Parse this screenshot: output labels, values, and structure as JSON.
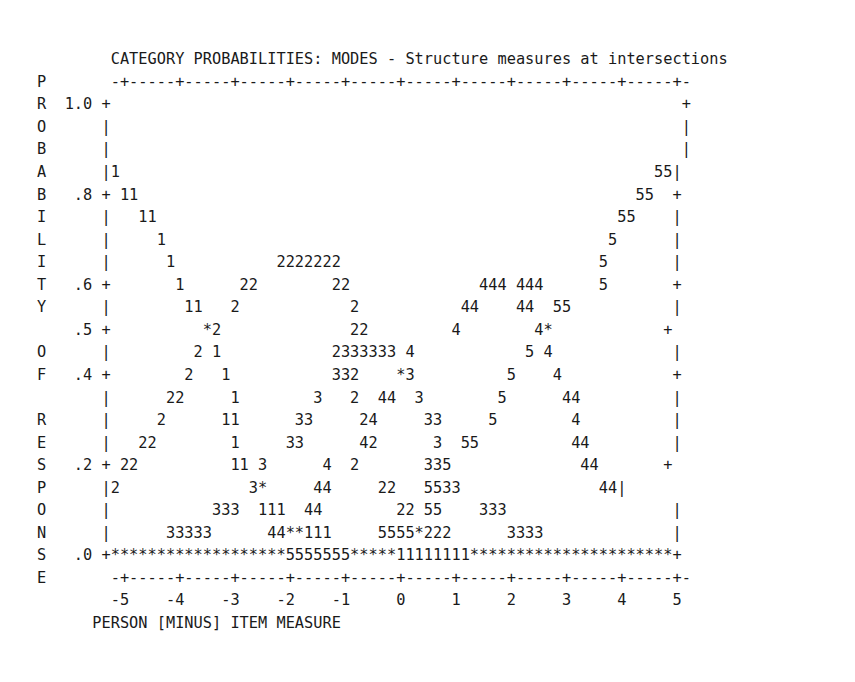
{
  "chart_data": {
    "type": "line",
    "title": "CATEGORY PROBABILITIES: MODES - Structure measures at intersections",
    "xlabel": "PERSON [MINUS] ITEM MEASURE",
    "ylabel": "PROBABILITY OF RESPONSE",
    "xlim": [
      -5.5,
      5.5
    ],
    "ylim": [
      0.0,
      1.0
    ],
    "xticks": [
      "-5",
      "-4",
      "-3",
      "-2",
      "-1",
      "0",
      "1",
      "2",
      "3",
      "4",
      "5"
    ],
    "yticks": [
      "1.0",
      ".8",
      ".6",
      ".5",
      ".4",
      ".2",
      ".0"
    ],
    "grid": false,
    "legend": "none",
    "series": [
      {
        "name": "Category 1",
        "marker": "1"
      },
      {
        "name": "Category 2",
        "marker": "2"
      },
      {
        "name": "Category 3",
        "marker": "3"
      },
      {
        "name": "Category 4",
        "marker": "4"
      },
      {
        "name": "Category 5",
        "marker": "5"
      },
      {
        "name": "Overlap",
        "marker": "*"
      }
    ]
  },
  "plot": {
    "title": "        CATEGORY PROBABILITIES: MODES - Structure measures at intersections",
    "xaxis_label_line": "      PERSON [MINUS] ITEM MEASURE",
    "rows": [
      "P       -+-----+-----+-----+-----+-----+-----+-----+-----+-----+-----+-",
      "R  1.0 +                                                              +",
      "O      |                                                              |",
      "B      |                                                              |",
      "A      |1                                                          55|",
      "B   .8 + 11                                                      55  +",
      "I      |   11                                                  55    |",
      "L      |     1                                                5      |",
      "I      |      1           2222222                            5       |",
      "T   .6 +       1      22        22              444 444      5       +",
      "Y      |        11   2            2           44    44  55           |",
      "    .5 +          *2              22         4        4*            +",
      "O      |         2 1            2333333 4            5 4             |",
      "F   .4 +        2   1           332    *3          5    4            +",
      "       |      22     1        3   2  44  3        5      44          |",
      "R      |     2      11      33     24     33     5        4          |",
      "E      |   22        1     33      42      3  55          44         |",
      "S   .2 + 22          11 3      4  2       335              44       +",
      "P      |2              3*     44     22   5533               44|",
      "O      |           333  111  44        22 55    333                  |",
      "N      |      33333      44**111     5555*222      3333              |",
      "S   .0 +*******************5555555*****11111111**********************+",
      "E       -+-----+-----+-----+-----+-----+-----+-----+-----+-----+-----+-",
      "        -5    -4    -3    -2    -1     0     1     2     3     4     5"
    ]
  }
}
